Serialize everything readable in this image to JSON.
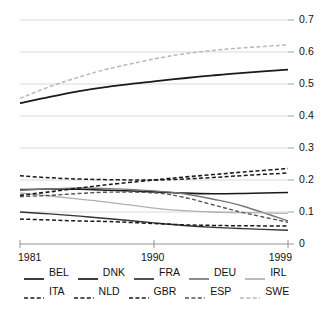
{
  "axes": {
    "y_ticks": [
      "0",
      "0.1",
      "0.2",
      "0.3",
      "0.4",
      "0.5",
      "0.6",
      "0.7"
    ],
    "x_ticks": [
      "1981",
      "1990",
      "1999"
    ]
  },
  "legend": {
    "row1": [
      {
        "label": "BEL",
        "style": "solid",
        "color": "#1a1a1a"
      },
      {
        "label": "DNK",
        "style": "solid",
        "color": "#1a1a1a"
      },
      {
        "label": "FRA",
        "style": "solid",
        "color": "#333333"
      },
      {
        "label": "DEU",
        "style": "solid",
        "color": "#777777"
      },
      {
        "label": "IRL",
        "style": "solid",
        "color": "#b0b0b0"
      }
    ],
    "row2": [
      {
        "label": "ITA",
        "style": "dashed",
        "color": "#1a1a1a"
      },
      {
        "label": "NLD",
        "style": "dashed",
        "color": "#1a1a1a"
      },
      {
        "label": "GBR",
        "style": "dashed",
        "color": "#1a1a1a"
      },
      {
        "label": "ESP",
        "style": "dashed",
        "color": "#555555"
      },
      {
        "label": "SWE",
        "style": "dashed",
        "color": "#b8b8b8"
      }
    ]
  },
  "chart_data": {
    "type": "line",
    "title": "",
    "xlabel": "",
    "ylabel": "",
    "xlim": [
      1981,
      1999
    ],
    "ylim": [
      0,
      0.7
    ],
    "grid": true,
    "legend_position": "bottom",
    "x": [
      1981,
      1983,
      1985,
      1987,
      1990,
      1992,
      1994,
      1996,
      1999
    ],
    "series": [
      {
        "name": "BEL",
        "style": "solid",
        "color": "#1a1a1a",
        "width": 1.6,
        "values": [
          0.17,
          0.172,
          0.171,
          0.168,
          0.163,
          0.159,
          0.157,
          0.158,
          0.161
        ]
      },
      {
        "name": "DNK",
        "style": "solid",
        "color": "#1a1a1a",
        "width": 1.8,
        "values": [
          0.44,
          0.46,
          0.478,
          0.492,
          0.508,
          0.518,
          0.527,
          0.535,
          0.545
        ]
      },
      {
        "name": "FRA",
        "style": "solid",
        "color": "#333333",
        "width": 1.4,
        "values": [
          0.1,
          0.094,
          0.087,
          0.079,
          0.066,
          0.058,
          0.052,
          0.048,
          0.043
        ]
      },
      {
        "name": "DEU",
        "style": "solid",
        "color": "#777777",
        "width": 1.4,
        "values": [
          0.168,
          0.172,
          0.175,
          0.173,
          0.166,
          0.157,
          0.14,
          0.118,
          0.072
        ]
      },
      {
        "name": "IRL",
        "style": "solid",
        "color": "#b0b0b0",
        "width": 1.3,
        "values": [
          0.16,
          0.15,
          0.14,
          0.13,
          0.112,
          0.104,
          0.1,
          0.098,
          0.096
        ]
      },
      {
        "name": "ITA",
        "style": "dashed",
        "color": "#1a1a1a",
        "width": 1.5,
        "values": [
          0.213,
          0.207,
          0.203,
          0.201,
          0.2,
          0.203,
          0.208,
          0.214,
          0.222
        ]
      },
      {
        "name": "NLD",
        "style": "dashed",
        "color": "#1a1a1a",
        "width": 1.5,
        "values": [
          0.078,
          0.075,
          0.072,
          0.07,
          0.064,
          0.06,
          0.058,
          0.057,
          0.056
        ]
      },
      {
        "name": "GBR",
        "style": "dashed",
        "color": "#1a1a1a",
        "width": 1.6,
        "values": [
          0.152,
          0.163,
          0.175,
          0.186,
          0.2,
          0.209,
          0.217,
          0.225,
          0.236
        ]
      },
      {
        "name": "ESP",
        "style": "dashed",
        "color": "#555555",
        "width": 1.4,
        "values": [
          0.148,
          0.152,
          0.158,
          0.162,
          0.16,
          0.146,
          0.122,
          0.098,
          0.068
        ]
      },
      {
        "name": "SWE",
        "style": "dashed",
        "color": "#b8b8b8",
        "width": 1.5,
        "values": [
          0.455,
          0.492,
          0.522,
          0.548,
          0.578,
          0.594,
          0.605,
          0.613,
          0.622
        ]
      }
    ]
  }
}
